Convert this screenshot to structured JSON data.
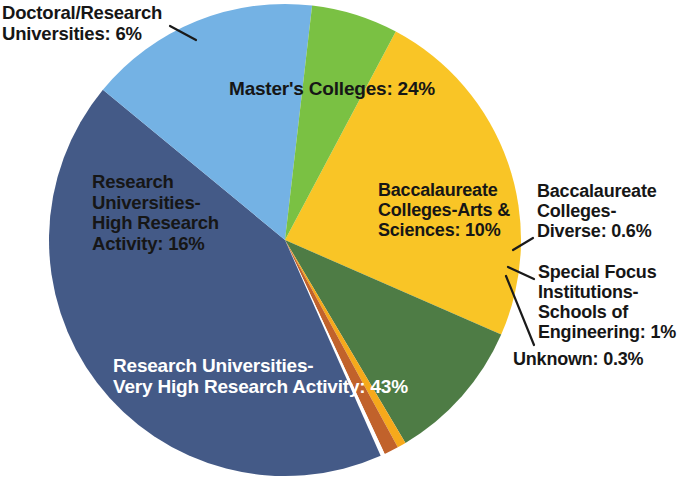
{
  "chart_data": {
    "type": "pie",
    "title": "",
    "subtitle": "",
    "xlabel": "",
    "ylabel": "",
    "legend_position": "none",
    "grid": false,
    "labels_inline": true,
    "categories": [
      "Master's Colleges",
      "Baccalaureate Colleges-Arts & Sciences",
      "Baccalaureate Colleges-Diverse",
      "Special Focus Institutions-Schools of Engineering",
      "Unknown",
      "Research Universities-Very High Research Activity",
      "Research Universities-High Research Activity",
      "Doctoral/Research Universities"
    ],
    "values": [
      24,
      10,
      0.6,
      1,
      0.3,
      43,
      16,
      6
    ],
    "value_unit": "%",
    "colors": [
      "#f9c526",
      "#4e7c45",
      "#f6a91b",
      "#c1622b",
      "#ffffff",
      "#445a87",
      "#74b2e4",
      "#7ac143"
    ],
    "slices": [
      {
        "name": "Master's Colleges",
        "value": 24,
        "color": "#f9c526"
      },
      {
        "name": "Baccalaureate Colleges-Arts & Sciences",
        "value": 10,
        "color": "#4e7c45"
      },
      {
        "name": "Baccalaureate Colleges-Diverse",
        "value": 0.6,
        "color": "#f6a91b"
      },
      {
        "name": "Special Focus Institutions-Schools of Engineering",
        "value": 1,
        "color": "#c1622b"
      },
      {
        "name": "Unknown",
        "value": 0.3,
        "color": "#ffffff"
      },
      {
        "name": "Research Universities-Very High Research Activity",
        "value": 43,
        "color": "#445a87"
      },
      {
        "name": "Research Universities-High Research Activity",
        "value": 16,
        "color": "#74b2e4"
      },
      {
        "name": "Doctoral/Research Universities",
        "value": 6,
        "color": "#7ac143"
      }
    ]
  },
  "labels": {
    "doctoral": "Doctoral/Research\nUniversities: 6%",
    "masters": "Master's Colleges: 24%",
    "research_high": "Research\nUniversities-\nHigh Research\nActivity: 16%",
    "bacc_arts": "Baccalaureate\nColleges-Arts &\nSciences: 10%",
    "bacc_diverse": "Baccalaureate\nColleges-\nDiverse: 0.6%",
    "special_focus": "Special Focus\nInstitutions-\nSchools of\nEngineering: 1%",
    "unknown": "Unknown: 0.3%",
    "research_veryhigh": "Research Universities-\nVery High Research Activity: 43%"
  },
  "colors": {
    "masters_yellow": "#f9c526",
    "doctoral_green": "#7ac143",
    "research_high_blue": "#74b2e4",
    "research_veryhigh_navy": "#445a87",
    "bacc_arts_darkgreen": "#4e7c45",
    "bacc_diverse_gold": "#f6a91b",
    "special_focus_orange": "#c1622b",
    "unknown_white": "#ffffff",
    "text_dark": "#161616",
    "text_light": "#ffffff",
    "leader_line": "#1a1a1a",
    "background": "#ffffff"
  }
}
